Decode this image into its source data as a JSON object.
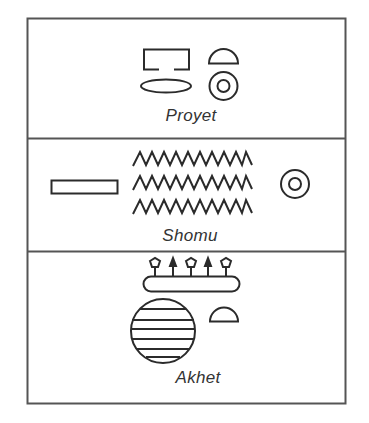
{
  "figure": {
    "type": "egyptian-seasons-hieroglyph-chart",
    "stroke_color": "#2b2b2b",
    "border_color": "#555555",
    "background": "#ffffff"
  },
  "panels": [
    {
      "name": "Proyet",
      "label": "Proyet",
      "glyphs": [
        "open-rectangle-house",
        "flat-ellipse",
        "half-dome-bread",
        "double-circle-sun"
      ]
    },
    {
      "name": "Shomu",
      "label": "Shomu",
      "glyphs": [
        "long-rectangle-pool",
        "triple-zigzag-water",
        "double-circle-sun"
      ]
    },
    {
      "name": "Akhet",
      "label": "Akhet",
      "glyphs": [
        "plants-on-rounded-bar",
        "striped-circle-placenta",
        "half-dome-bread"
      ]
    }
  ]
}
